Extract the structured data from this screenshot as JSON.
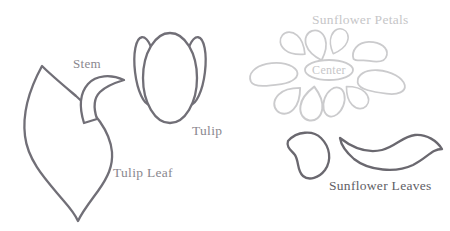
{
  "canvas": {
    "width": 450,
    "height": 231,
    "background": "#ffffff"
  },
  "tulip_section": {
    "stem_label": "Stem",
    "tulip_label": "Tulip",
    "leaf_label": "Tulip Leaf"
  },
  "sunflower_section": {
    "petals_label": "Sunflower Petals",
    "center_label": "Center",
    "leaves_label": "Sunflower Leaves"
  },
  "colors": {
    "tulip_outline": "#716f77",
    "tulip_label_text": "#8a878e",
    "sunflower_petal_outline": "#cbcbcd",
    "sunflower_petal_text": "#c6c6c8",
    "sunflower_leaf_outline": "#6a686f",
    "sunflower_leaf_text": "#605e65",
    "background": "#ffffff"
  }
}
